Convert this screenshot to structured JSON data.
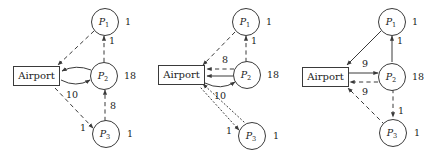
{
  "figure": {
    "background": "#ffffff",
    "ink": "#3a3a3a",
    "panel_count": 3
  },
  "nodes": {
    "depot_label": "Airport",
    "p1_name": "P",
    "p1_sub": "1",
    "p2_name": "P",
    "p2_sub": "2",
    "p3_name": "P",
    "p3_sub": "3",
    "p1_demand": "1",
    "p2_demand": "18",
    "p3_demand": "1"
  },
  "panels": [
    {
      "id": "panel-a",
      "name": "left-panel",
      "edge_labels": {
        "p2_to_p1": "1",
        "airport_p2_lower": "10",
        "p3_to_p2": "8",
        "airport_to_p3": "1"
      },
      "edges": [
        {
          "from": "P1",
          "to": "Airport",
          "style": "dashed",
          "label": ""
        },
        {
          "from": "P2",
          "to": "P1",
          "style": "dashed",
          "label": "1"
        },
        {
          "from": "P2",
          "to": "Airport",
          "style": "solid",
          "label": ""
        },
        {
          "from": "Airport",
          "to": "P2",
          "style": "solid",
          "label": "10"
        },
        {
          "from": "P3",
          "to": "P2",
          "style": "dashed",
          "label": "8"
        },
        {
          "from": "Airport",
          "to": "P3",
          "style": "dashed",
          "label": "1"
        }
      ]
    },
    {
      "id": "panel-b",
      "name": "middle-panel",
      "edge_labels": {
        "p2_to_p1": "1",
        "p2_to_airport_dashed": "8",
        "airport_p2_lower": "10",
        "airport_p3_dotted": "1"
      },
      "edges": [
        {
          "from": "P1",
          "to": "Airport",
          "style": "dashed",
          "label": ""
        },
        {
          "from": "P2",
          "to": "P1",
          "style": "dashed",
          "label": "1"
        },
        {
          "from": "P2",
          "to": "Airport",
          "style": "dashed",
          "label": "8"
        },
        {
          "from": "P2",
          "to": "Airport",
          "style": "solid",
          "label": ""
        },
        {
          "from": "Airport",
          "to": "P2",
          "style": "solid",
          "label": "10"
        },
        {
          "from": "Airport",
          "to": "P3",
          "style": "dotted",
          "label": "1"
        },
        {
          "from": "P3",
          "to": "Airport",
          "style": "dotted",
          "label": ""
        }
      ]
    },
    {
      "id": "panel-c",
      "name": "right-panel",
      "edge_labels": {
        "p2_to_p1": "1",
        "airport_to_p2": "9",
        "p2_to_airport": "9",
        "p2_to_p3": "1"
      },
      "edges": [
        {
          "from": "P1",
          "to": "Airport",
          "style": "solid",
          "label": ""
        },
        {
          "from": "P2",
          "to": "P1",
          "style": "solid",
          "label": "1"
        },
        {
          "from": "Airport",
          "to": "P2",
          "style": "solid",
          "label": "9"
        },
        {
          "from": "P2",
          "to": "Airport",
          "style": "dashed",
          "label": "9"
        },
        {
          "from": "P2",
          "to": "P3",
          "style": "dashed",
          "label": "1"
        },
        {
          "from": "P3",
          "to": "Airport",
          "style": "dashed",
          "label": ""
        }
      ]
    }
  ]
}
